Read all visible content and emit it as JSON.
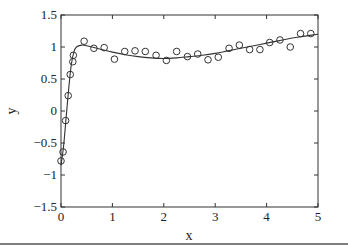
{
  "chart_data": {
    "type": "scatter",
    "title": "",
    "xlabel": "x",
    "ylabel": "y",
    "xlim": [
      0,
      5
    ],
    "ylim": [
      -1.5,
      1.5
    ],
    "xticks": [
      0,
      1,
      2,
      3,
      4,
      5
    ],
    "xtick_labels": [
      "0",
      "1",
      "2",
      "3",
      "4",
      "5"
    ],
    "yticks": [
      -1.5,
      -1,
      -0.5,
      0,
      0.5,
      1,
      1.5
    ],
    "ytick_labels": [
      "−1.5",
      "−1",
      "−0.5",
      "0",
      "0.5",
      "1",
      "1.5"
    ],
    "grid": false,
    "legend": null,
    "series": [
      {
        "name": "data",
        "style": "open-circle markers",
        "x": [
          0.0,
          0.04,
          0.09,
          0.14,
          0.18,
          0.23,
          0.24,
          0.45,
          0.64,
          0.84,
          1.04,
          1.24,
          1.44,
          1.64,
          1.85,
          2.05,
          2.25,
          2.46,
          2.66,
          2.86,
          3.06,
          3.27,
          3.47,
          3.67,
          3.87,
          4.06,
          4.26,
          4.46,
          4.66,
          4.86
        ],
        "y": [
          -0.78,
          -0.64,
          -0.15,
          0.24,
          0.57,
          0.77,
          0.87,
          1.09,
          0.98,
          0.99,
          0.81,
          0.93,
          0.94,
          0.93,
          0.87,
          0.79,
          0.93,
          0.85,
          0.89,
          0.8,
          0.84,
          0.98,
          1.03,
          0.96,
          0.96,
          1.07,
          1.11,
          1.0,
          1.21,
          1.21
        ]
      },
      {
        "name": "fit",
        "style": "solid line",
        "x": [
          0.0,
          0.05,
          0.1,
          0.15,
          0.2,
          0.25,
          0.3,
          0.4,
          0.5,
          0.75,
          1.0,
          1.25,
          1.5,
          1.75,
          2.0,
          2.25,
          2.5,
          2.75,
          3.0,
          3.25,
          3.5,
          3.75,
          4.0,
          4.25,
          4.5,
          4.75,
          5.0
        ],
        "y": [
          -0.85,
          -0.55,
          -0.1,
          0.35,
          0.72,
          0.92,
          1.0,
          1.03,
          1.02,
          0.97,
          0.92,
          0.88,
          0.85,
          0.83,
          0.82,
          0.83,
          0.85,
          0.87,
          0.9,
          0.94,
          0.98,
          1.02,
          1.06,
          1.1,
          1.14,
          1.17,
          1.2
        ]
      }
    ]
  }
}
